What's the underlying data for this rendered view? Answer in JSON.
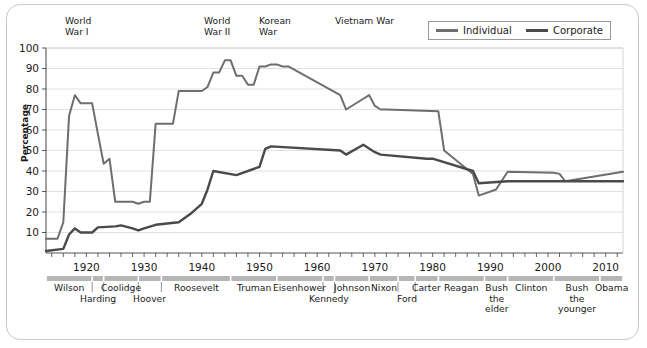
{
  "chart_data": {
    "type": "line",
    "title": "",
    "xlabel": "",
    "ylabel": "Percentage",
    "xlim": [
      1913,
      2013
    ],
    "ylim": [
      0,
      100
    ],
    "grid": true,
    "legend_position": "top-right",
    "y_ticks": [
      10,
      20,
      30,
      40,
      50,
      60,
      70,
      80,
      90,
      100
    ],
    "x_ticks_labeled": [
      1920,
      1930,
      1940,
      1950,
      1960,
      1970,
      1980,
      1990,
      2000,
      2010
    ],
    "x_tick_step": 2,
    "series": [
      {
        "name": "Individual",
        "color": "#6e6e6e",
        "x": [
          1913,
          1914,
          1915,
          1916,
          1917,
          1918,
          1919,
          1920,
          1921,
          1922,
          1923,
          1924,
          1925,
          1926,
          1927,
          1928,
          1929,
          1930,
          1931,
          1932,
          1933,
          1934,
          1935,
          1936,
          1937,
          1938,
          1939,
          1940,
          1941,
          1942,
          1943,
          1944,
          1945,
          1946,
          1947,
          1948,
          1949,
          1950,
          1951,
          1952,
          1953,
          1954,
          1955,
          1964,
          1965,
          1968,
          1969,
          1970,
          1971,
          1972,
          1981,
          1982,
          1987,
          1988,
          1991,
          1993,
          2001,
          2002,
          2003,
          2013
        ],
        "values": [
          7,
          7,
          7,
          15,
          67,
          77,
          73,
          73,
          73,
          58,
          43.5,
          46,
          25,
          25,
          25,
          25,
          24,
          25,
          25,
          63,
          63,
          63,
          63,
          79,
          79,
          79,
          79,
          79,
          81,
          88,
          88,
          94,
          94,
          86.45,
          86.45,
          82.13,
          82.13,
          91,
          91,
          92,
          92,
          91,
          91,
          77,
          70,
          75.25,
          77,
          71.75,
          70,
          70,
          69.125,
          50,
          38.5,
          28,
          31,
          39.6,
          39.1,
          38.6,
          35,
          39.6
        ]
      },
      {
        "name": "Corporate",
        "color": "#4a4a4a",
        "x": [
          1913,
          1916,
          1917,
          1918,
          1919,
          1921,
          1922,
          1925,
          1926,
          1928,
          1929,
          1930,
          1932,
          1936,
          1938,
          1940,
          1941,
          1942,
          1946,
          1950,
          1951,
          1952,
          1964,
          1965,
          1968,
          1970,
          1971,
          1979,
          1980,
          1987,
          1988,
          1993,
          2013
        ],
        "values": [
          1,
          2,
          9,
          12,
          10,
          10,
          12.5,
          13,
          13.5,
          12,
          11,
          12,
          13.75,
          15,
          19,
          24,
          31,
          40,
          38,
          42,
          50.75,
          52,
          50,
          48,
          52.8,
          49.2,
          48,
          46,
          46,
          40,
          34,
          35,
          35
        ]
      }
    ],
    "annotations": [
      {
        "label": "World\nWar I",
        "year": 1917
      },
      {
        "label": "World\nWar II",
        "year": 1941
      },
      {
        "label": "Korean\nWar",
        "year": 1950
      },
      {
        "label": "Vietnam War",
        "year": 1964
      }
    ]
  },
  "legend": {
    "items": [
      {
        "label": "Individual"
      },
      {
        "label": "Corporate"
      }
    ]
  },
  "axis": {
    "y_title": "Percentage",
    "y_labels": [
      "100",
      "90",
      "80",
      "70",
      "60",
      "50",
      "40",
      "30",
      "20",
      "10"
    ],
    "x_labels": [
      "1920",
      "1930",
      "1940",
      "1950",
      "1960",
      "1970",
      "1980",
      "1990",
      "2000",
      "2010"
    ]
  },
  "annotations": {
    "wwi_line1": "World",
    "wwi_line2": "War I",
    "wwii_line1": "World",
    "wwii_line2": "War II",
    "korean_line1": "Korean",
    "korean_line2": "War",
    "vietnam": "Vietnam War"
  },
  "presidents": [
    {
      "name": "Wilson",
      "start": 1913,
      "end": 1921,
      "row": 0
    },
    {
      "name": "Harding",
      "start": 1921,
      "end": 1923,
      "row": 1
    },
    {
      "name": "Coolidge",
      "start": 1923,
      "end": 1929,
      "row": 0
    },
    {
      "name": "Hoover",
      "start": 1929,
      "end": 1933,
      "row": 1
    },
    {
      "name": "Roosevelt",
      "start": 1933,
      "end": 1945,
      "row": 0
    },
    {
      "name": "Truman",
      "start": 1945,
      "end": 1953,
      "row": 0
    },
    {
      "name": "Eisenhower",
      "start": 1953,
      "end": 1961,
      "row": 0
    },
    {
      "name": "Kennedy",
      "start": 1961,
      "end": 1963,
      "row": 1
    },
    {
      "name": "Johnson",
      "start": 1963,
      "end": 1969,
      "row": 0
    },
    {
      "name": "Nixon",
      "start": 1969,
      "end": 1974,
      "row": 0
    },
    {
      "name": "Ford",
      "start": 1974,
      "end": 1977,
      "row": 1
    },
    {
      "name": "Carter",
      "start": 1977,
      "end": 1981,
      "row": 0
    },
    {
      "name": "Reagan",
      "start": 1981,
      "end": 1989,
      "row": 0
    },
    {
      "name": "Bush\nthe\nelder",
      "start": 1989,
      "end": 1993,
      "row": 0
    },
    {
      "name": "Clinton",
      "start": 1993,
      "end": 2001,
      "row": 0
    },
    {
      "name": "Bush\nthe\nyounger",
      "start": 2001,
      "end": 2009,
      "row": 0
    },
    {
      "name": "Obama",
      "start": 2009,
      "end": 2013,
      "row": 0
    }
  ]
}
